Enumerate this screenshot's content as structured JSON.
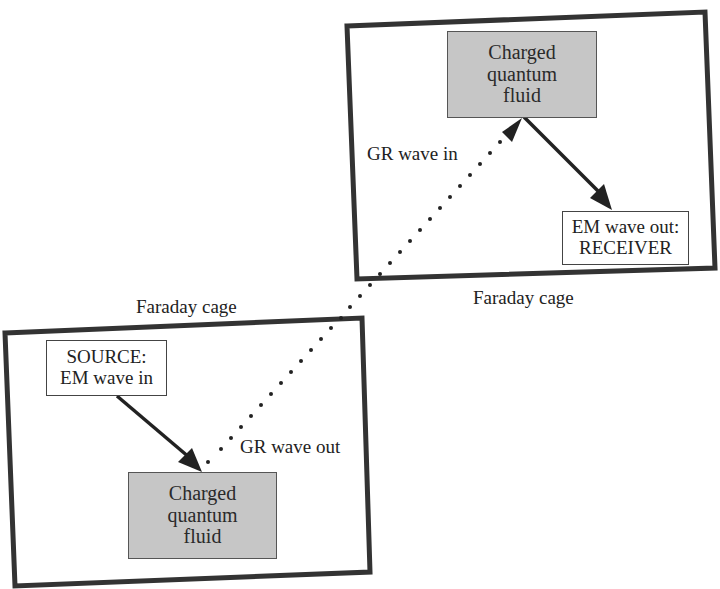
{
  "diagram": {
    "colors": {
      "cage_border": "#333333",
      "fluid_fill": "#c6c6c6",
      "arrow": "#222222",
      "background": "#ffffff"
    },
    "top_cage": {
      "label": "Faraday cage",
      "fluid_box": {
        "lines": [
          "Charged",
          "quantum",
          "fluid"
        ]
      },
      "receiver_box": {
        "lines": [
          "EM wave out:",
          "RECEIVER"
        ]
      },
      "gr_label": "GR wave in"
    },
    "bottom_cage": {
      "label": "Faraday cage",
      "source_box": {
        "lines": [
          "SOURCE:",
          "EM wave in"
        ]
      },
      "fluid_box": {
        "lines": [
          "Charged",
          "quantum",
          "fluid"
        ]
      },
      "gr_label": "GR wave out"
    },
    "edges": [
      {
        "from": "SOURCE: EM wave in",
        "to": "Charged quantum fluid (bottom)",
        "style": "solid-arrow"
      },
      {
        "from": "Charged quantum fluid (bottom)",
        "to": "Charged quantum fluid (top)",
        "style": "dotted-arrow",
        "label_start": "GR wave out",
        "label_end": "GR wave in"
      },
      {
        "from": "Charged quantum fluid (top)",
        "to": "EM wave out: RECEIVER",
        "style": "solid-arrow"
      }
    ]
  }
}
